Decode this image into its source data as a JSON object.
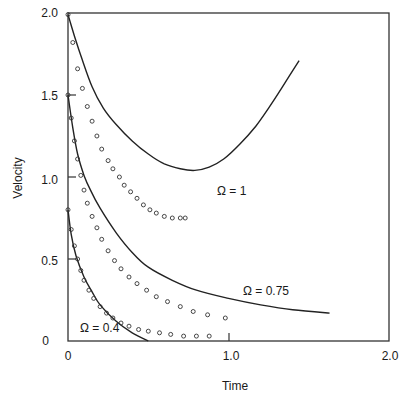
{
  "chart_data": {
    "type": "line",
    "title": "",
    "xlabel": "Time",
    "ylabel": "Velocity",
    "xlim": [
      0,
      2.0
    ],
    "ylim": [
      0,
      2.0
    ],
    "grid": false,
    "legend": "none (curves labelled inline)",
    "x_ticks": [
      {
        "value": 0,
        "label": "0"
      },
      {
        "value": 1.0,
        "label": "1.0"
      },
      {
        "value": 2.0,
        "label": "2.0"
      }
    ],
    "y_ticks": [
      {
        "value": 0,
        "label": "0"
      },
      {
        "value": 0.5,
        "label": "0.5"
      },
      {
        "value": 1.0,
        "label": "1.0"
      },
      {
        "value": 1.5,
        "label": "1.5"
      },
      {
        "value": 2.0,
        "label": "2.0"
      }
    ],
    "series": [
      {
        "name": "Ω = 1 (solid line)",
        "style": "line",
        "points": [
          [
            0,
            1.99
          ],
          [
            0.04,
            1.86
          ],
          [
            0.08,
            1.74
          ],
          [
            0.15,
            1.55
          ],
          [
            0.22,
            1.42
          ],
          [
            0.3,
            1.32
          ],
          [
            0.4,
            1.22
          ],
          [
            0.5,
            1.14
          ],
          [
            0.6,
            1.08
          ],
          [
            0.7,
            1.05
          ],
          [
            0.79,
            1.04
          ],
          [
            0.88,
            1.06
          ],
          [
            0.97,
            1.11
          ],
          [
            1.07,
            1.2
          ],
          [
            1.17,
            1.31
          ],
          [
            1.25,
            1.42
          ],
          [
            1.33,
            1.54
          ],
          [
            1.44,
            1.71
          ]
        ]
      },
      {
        "name": "Ω = 1 (circles)",
        "style": "markers",
        "points": [
          [
            0,
            1.99
          ],
          [
            0.03,
            1.82
          ],
          [
            0.06,
            1.66
          ],
          [
            0.09,
            1.54
          ],
          [
            0.12,
            1.43
          ],
          [
            0.15,
            1.34
          ],
          [
            0.18,
            1.25
          ],
          [
            0.21,
            1.17
          ],
          [
            0.25,
            1.1
          ],
          [
            0.28,
            1.05
          ],
          [
            0.32,
            1.0
          ],
          [
            0.35,
            0.95
          ],
          [
            0.39,
            0.91
          ],
          [
            0.43,
            0.87
          ],
          [
            0.47,
            0.83
          ],
          [
            0.51,
            0.8
          ],
          [
            0.55,
            0.78
          ],
          [
            0.6,
            0.76
          ],
          [
            0.65,
            0.75
          ],
          [
            0.7,
            0.75
          ],
          [
            0.73,
            0.75
          ]
        ]
      },
      {
        "name": "Ω = 0.75 (solid line)",
        "style": "line",
        "points": [
          [
            0,
            1.5
          ],
          [
            0.03,
            1.3
          ],
          [
            0.06,
            1.14
          ],
          [
            0.1,
            1.01
          ],
          [
            0.14,
            0.92
          ],
          [
            0.2,
            0.81
          ],
          [
            0.3,
            0.66
          ],
          [
            0.4,
            0.54
          ],
          [
            0.5,
            0.45
          ],
          [
            0.65,
            0.37
          ],
          [
            0.8,
            0.31
          ],
          [
            1.0,
            0.26
          ],
          [
            1.2,
            0.22
          ],
          [
            1.4,
            0.19
          ],
          [
            1.63,
            0.17
          ]
        ]
      },
      {
        "name": "Ω = 0.75 (circles)",
        "style": "markers",
        "points": [
          [
            0,
            1.5
          ],
          [
            0.02,
            1.36
          ],
          [
            0.04,
            1.22
          ],
          [
            0.06,
            1.11
          ],
          [
            0.08,
            1.01
          ],
          [
            0.1,
            0.92
          ],
          [
            0.12,
            0.84
          ],
          [
            0.15,
            0.76
          ],
          [
            0.18,
            0.69
          ],
          [
            0.21,
            0.62
          ],
          [
            0.25,
            0.55
          ],
          [
            0.29,
            0.49
          ],
          [
            0.33,
            0.44
          ],
          [
            0.38,
            0.39
          ],
          [
            0.43,
            0.35
          ],
          [
            0.49,
            0.31
          ],
          [
            0.55,
            0.27
          ],
          [
            0.62,
            0.24
          ],
          [
            0.7,
            0.21
          ],
          [
            0.78,
            0.18
          ],
          [
            0.87,
            0.16
          ],
          [
            0.98,
            0.14
          ]
        ]
      },
      {
        "name": "Ω = 0.4 (solid line)",
        "style": "line",
        "points": [
          [
            0,
            0.8
          ],
          [
            0.02,
            0.65
          ],
          [
            0.05,
            0.52
          ],
          [
            0.1,
            0.39
          ],
          [
            0.15,
            0.3
          ],
          [
            0.2,
            0.22
          ],
          [
            0.3,
            0.12
          ],
          [
            0.4,
            0.05
          ],
          [
            0.5,
            0.0
          ]
        ]
      },
      {
        "name": "Ω = 0.4 (circles)",
        "style": "markers",
        "points": [
          [
            0,
            0.8
          ],
          [
            0.02,
            0.68
          ],
          [
            0.04,
            0.58
          ],
          [
            0.06,
            0.5
          ],
          [
            0.08,
            0.43
          ],
          [
            0.1,
            0.37
          ],
          [
            0.13,
            0.31
          ],
          [
            0.16,
            0.26
          ],
          [
            0.2,
            0.21
          ],
          [
            0.24,
            0.17
          ],
          [
            0.28,
            0.14
          ],
          [
            0.33,
            0.11
          ],
          [
            0.38,
            0.09
          ],
          [
            0.44,
            0.07
          ],
          [
            0.5,
            0.06
          ],
          [
            0.57,
            0.05
          ],
          [
            0.64,
            0.04
          ],
          [
            0.72,
            0.03
          ],
          [
            0.8,
            0.03
          ],
          [
            0.88,
            0.03
          ]
        ]
      }
    ],
    "annotations": [
      {
        "text": "Ω = 1",
        "x": 0.93,
        "y": 0.92
      },
      {
        "text": "Ω = 0.75",
        "x": 1.1,
        "y": 0.3
      },
      {
        "text": "Ω = 0.4",
        "x": 0.05,
        "y": 0.05
      }
    ]
  },
  "labels": {
    "xlabel": "Time",
    "ylabel": "Velocity",
    "annot_1": "Ω = 1",
    "annot_075": "Ω = 0.75",
    "annot_04": "Ω = 0.4",
    "xt0": "0",
    "xt1": "1.0",
    "xt2": "2.0",
    "yt0": "0",
    "yt05": "0.5",
    "yt1": "1.0",
    "yt15": "1.5",
    "yt2": "2.0"
  }
}
